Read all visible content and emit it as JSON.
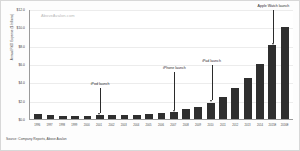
{
  "watermark": "AboveAvalon.com",
  "source_note": "Source: Company Reports, Above Avalon",
  "chart_data": {
    "type": "bar",
    "title": "",
    "xlabel": "",
    "ylabel": "Annual R&D Expense ($ billions)",
    "ylim": [
      0,
      12
    ],
    "ytick_labels": [
      "$12.0",
      "$10.0",
      "$8.0",
      "$6.0",
      "$4.0",
      "$2.0",
      "$0.0"
    ],
    "ytick_values": [
      12,
      10,
      8,
      6,
      4,
      2,
      0
    ],
    "grid": true,
    "legend": "none",
    "bar_color": "#2f2f2f",
    "categories": [
      "1996",
      "1997",
      "1998",
      "1999",
      "2000",
      "2001",
      "2002",
      "2003",
      "2004",
      "2005",
      "2006",
      "2007",
      "2008",
      "2009",
      "2010",
      "2011",
      "2012",
      "2013",
      "2014",
      "2015E",
      "2016E"
    ],
    "values": [
      0.6,
      0.49,
      0.3,
      0.31,
      0.38,
      0.43,
      0.45,
      0.47,
      0.49,
      0.53,
      0.71,
      0.78,
      1.11,
      1.33,
      1.78,
      2.43,
      3.38,
      4.48,
      6.04,
      8.07,
      10.05
    ],
    "annotations": [
      {
        "text": "iPod launch",
        "category": "2001"
      },
      {
        "text": "iPhone launch",
        "category": "2007"
      },
      {
        "text": "iPad launch",
        "category": "2010"
      },
      {
        "text": "Apple Watch launch",
        "category": "2015E"
      }
    ]
  }
}
